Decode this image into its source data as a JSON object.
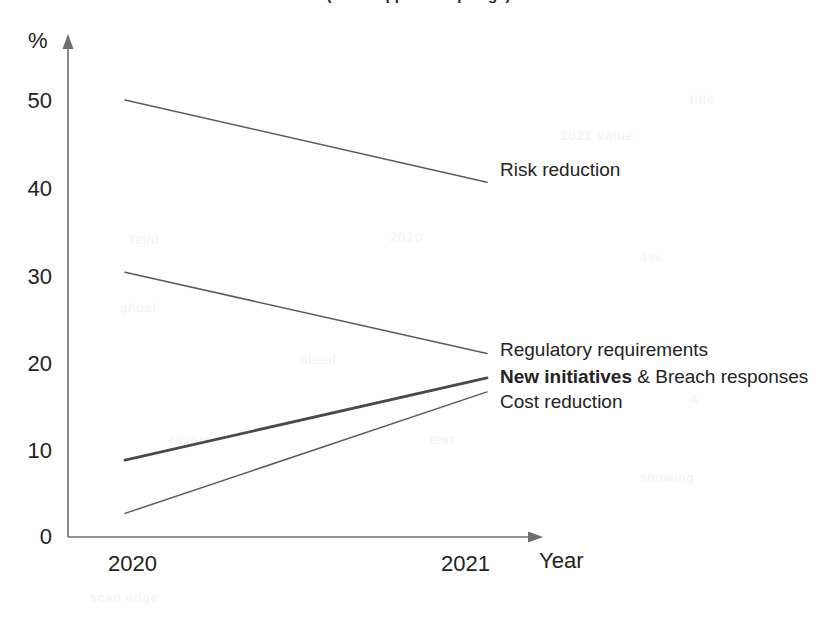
{
  "title": "(title cropped at top edge)",
  "chart_data": {
    "type": "line",
    "title": "",
    "xlabel": "Year",
    "ylabel": "%",
    "categories": [
      "2020",
      "2021"
    ],
    "x": [
      2020,
      2021
    ],
    "ylim": [
      0,
      55
    ],
    "yticks": [
      0,
      10,
      20,
      30,
      40,
      50
    ],
    "grid": false,
    "legend_position": "right-of-line-end",
    "series": [
      {
        "name": "Risk reduction",
        "values": [
          50.0,
          40.6
        ],
        "emphasis": false
      },
      {
        "name": "Regulatory requirements",
        "values": [
          30.3,
          21.0
        ],
        "emphasis": false
      },
      {
        "name": "New initiatives & Breach responses",
        "values": [
          8.8,
          18.2
        ],
        "emphasis": true
      },
      {
        "name": "Cost reduction",
        "values": [
          2.7,
          16.6
        ],
        "emphasis": false
      }
    ],
    "annotations": []
  },
  "axes": {
    "y_label": "%",
    "x_label": "Year",
    "y_ticks": [
      "50",
      "40",
      "30",
      "20",
      "10",
      "0"
    ],
    "x_ticks": [
      "2020",
      "2021"
    ]
  },
  "labels": {
    "risk_reduction": "Risk reduction",
    "regulatory_requirements": "Regulatory requirements",
    "new_initiatives_bold": "New initiatives",
    "new_initiatives_rest": " & Breach responses",
    "cost_reduction": "Cost reduction"
  },
  "colors": {
    "line": "#5c5c5c",
    "line_emphasis": "#4a4a4a",
    "axis": "#6e6e6e",
    "text": "#232323",
    "background": "#ffffff"
  }
}
